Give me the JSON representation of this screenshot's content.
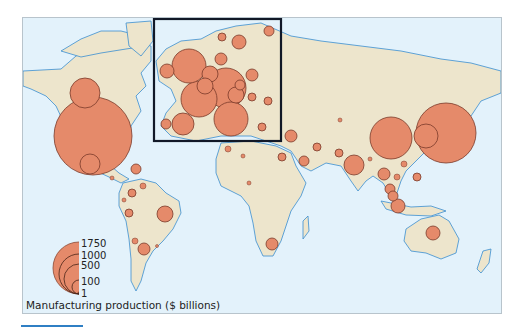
{
  "figure": {
    "title": "",
    "legend": {
      "title": "Manufacturing production ($ billions)",
      "sizes": [
        {
          "label": "1750",
          "value": 1750,
          "r": 26
        },
        {
          "label": "1000",
          "value": 1000,
          "r": 20
        },
        {
          "label": "500",
          "value": 500,
          "r": 15
        },
        {
          "label": "100",
          "value": 100,
          "r": 7
        },
        {
          "label": "1",
          "value": 1,
          "r": 1
        }
      ]
    },
    "inset": {
      "label": "Europe enlargement"
    }
  },
  "colors": {
    "ocean": "#e3f2fb",
    "land": "#ede5cc",
    "coast": "#3a8ed0",
    "border": "#6d6a55",
    "bubble_fill": "#e58a6a",
    "bubble_stroke": "#7a3a2a",
    "inset_frame": "#111827",
    "rule": "#2f7fc4"
  },
  "chart_data": {
    "type": "proportional-symbol-map",
    "title": "",
    "legend_title": "Manufacturing production ($ billions)",
    "legend_values": [
      1750,
      1000,
      500,
      100,
      1
    ],
    "symbols": [
      {
        "region": "United States",
        "x": 92,
        "y": 135,
        "r": 39,
        "approx_value": 1750
      },
      {
        "region": "Canada",
        "x": 84,
        "y": 92,
        "r": 15,
        "approx_value": 250
      },
      {
        "region": "Mexico",
        "x": 89,
        "y": 163,
        "r": 10,
        "approx_value": 120
      },
      {
        "region": "Caribbean",
        "x": 135,
        "y": 168,
        "r": 5,
        "approx_value": 30
      },
      {
        "region": "Central America",
        "x": 111,
        "y": 177,
        "r": 2,
        "approx_value": 5
      },
      {
        "region": "Venezuela",
        "x": 142,
        "y": 185,
        "r": 3,
        "approx_value": 15
      },
      {
        "region": "Colombia",
        "x": 131,
        "y": 192,
        "r": 4,
        "approx_value": 20
      },
      {
        "region": "Ecuador",
        "x": 123,
        "y": 199,
        "r": 2,
        "approx_value": 4
      },
      {
        "region": "Peru",
        "x": 128,
        "y": 212,
        "r": 4,
        "approx_value": 15
      },
      {
        "region": "Brazil",
        "x": 164,
        "y": 213,
        "r": 8,
        "approx_value": 100
      },
      {
        "region": "Chile",
        "x": 134,
        "y": 240,
        "r": 3,
        "approx_value": 12
      },
      {
        "region": "Argentina",
        "x": 143,
        "y": 248,
        "r": 6,
        "approx_value": 50
      },
      {
        "region": "Uruguay",
        "x": 156,
        "y": 245,
        "r": 1.5,
        "approx_value": 3
      },
      {
        "region": "United Kingdom",
        "x": 188,
        "y": 65,
        "r": 17,
        "approx_value": 300
      },
      {
        "region": "Ireland",
        "x": 166,
        "y": 70,
        "r": 7,
        "approx_value": 50
      },
      {
        "region": "Germany",
        "x": 225,
        "y": 87,
        "r": 20,
        "approx_value": 500
      },
      {
        "region": "France",
        "x": 198,
        "y": 98,
        "r": 18,
        "approx_value": 350
      },
      {
        "region": "Italy",
        "x": 230,
        "y": 118,
        "r": 17,
        "approx_value": 300
      },
      {
        "region": "Spain",
        "x": 182,
        "y": 123,
        "r": 11,
        "approx_value": 140
      },
      {
        "region": "Portugal",
        "x": 165,
        "y": 123,
        "r": 5,
        "approx_value": 25
      },
      {
        "region": "Belgium",
        "x": 209,
        "y": 73,
        "r": 8,
        "approx_value": 60
      },
      {
        "region": "Netherlands",
        "x": 204,
        "y": 85,
        "r": 8,
        "approx_value": 60
      },
      {
        "region": "Denmark",
        "x": 220,
        "y": 58,
        "r": 6,
        "approx_value": 30
      },
      {
        "region": "Sweden",
        "x": 238,
        "y": 41,
        "r": 7,
        "approx_value": 50
      },
      {
        "region": "Norway",
        "x": 221,
        "y": 36,
        "r": 4,
        "approx_value": 20
      },
      {
        "region": "Finland",
        "x": 268,
        "y": 30,
        "r": 5,
        "approx_value": 30
      },
      {
        "region": "Poland",
        "x": 251,
        "y": 74,
        "r": 6,
        "approx_value": 40
      },
      {
        "region": "Switzerland",
        "x": 235,
        "y": 94,
        "r": 8,
        "approx_value": 60
      },
      {
        "region": "Austria",
        "x": 239,
        "y": 84,
        "r": 5,
        "approx_value": 35
      },
      {
        "region": "Czech Republic",
        "x": 251,
        "y": 96,
        "r": 4,
        "approx_value": 20
      },
      {
        "region": "Romania",
        "x": 267,
        "y": 100,
        "r": 4,
        "approx_value": 15
      },
      {
        "region": "Greece",
        "x": 261,
        "y": 126,
        "r": 4,
        "approx_value": 15
      },
      {
        "region": "Turkey",
        "x": 290,
        "y": 135,
        "r": 6,
        "approx_value": 50
      },
      {
        "region": "Russia",
        "x": 339,
        "y": 119,
        "r": 2,
        "approx_value": 5
      },
      {
        "region": "Egypt",
        "x": 281,
        "y": 156,
        "r": 4,
        "approx_value": 20
      },
      {
        "region": "Saudi Arabia",
        "x": 303,
        "y": 160,
        "r": 5,
        "approx_value": 30
      },
      {
        "region": "Iran",
        "x": 316,
        "y": 146,
        "r": 4,
        "approx_value": 20
      },
      {
        "region": "Pakistan",
        "x": 338,
        "y": 152,
        "r": 4,
        "approx_value": 15
      },
      {
        "region": "India",
        "x": 353,
        "y": 164,
        "r": 10,
        "approx_value": 120
      },
      {
        "region": "Bangladesh",
        "x": 369,
        "y": 158,
        "r": 2,
        "approx_value": 5
      },
      {
        "region": "Morocco",
        "x": 227,
        "y": 148,
        "r": 3,
        "approx_value": 10
      },
      {
        "region": "Algeria",
        "x": 242,
        "y": 155,
        "r": 2,
        "approx_value": 5
      },
      {
        "region": "Nigeria",
        "x": 248,
        "y": 182,
        "r": 2,
        "approx_value": 5
      },
      {
        "region": "South Africa",
        "x": 271,
        "y": 243,
        "r": 6,
        "approx_value": 40
      },
      {
        "region": "China",
        "x": 390,
        "y": 137,
        "r": 21,
        "approx_value": 550
      },
      {
        "region": "Japan",
        "x": 445,
        "y": 132,
        "r": 30,
        "approx_value": 1000
      },
      {
        "region": "South Korea",
        "x": 425,
        "y": 135,
        "r": 12,
        "approx_value": 150
      },
      {
        "region": "Taiwan",
        "x": 403,
        "y": 163,
        "r": 3,
        "approx_value": 15
      },
      {
        "region": "Thailand",
        "x": 383,
        "y": 173,
        "r": 6,
        "approx_value": 40
      },
      {
        "region": "Vietnam",
        "x": 396,
        "y": 176,
        "r": 3,
        "approx_value": 10
      },
      {
        "region": "Philippines",
        "x": 416,
        "y": 176,
        "r": 4,
        "approx_value": 20
      },
      {
        "region": "Malaysia",
        "x": 389,
        "y": 188,
        "r": 5,
        "approx_value": 30
      },
      {
        "region": "Singapore",
        "x": 392,
        "y": 195,
        "r": 5,
        "approx_value": 30
      },
      {
        "region": "Indonesia",
        "x": 397,
        "y": 205,
        "r": 7,
        "approx_value": 50
      },
      {
        "region": "Australia",
        "x": 432,
        "y": 232,
        "r": 7,
        "approx_value": 50
      }
    ],
    "inset_box": {
      "x": 153,
      "y": 18,
      "width": 127,
      "height": 122
    }
  }
}
